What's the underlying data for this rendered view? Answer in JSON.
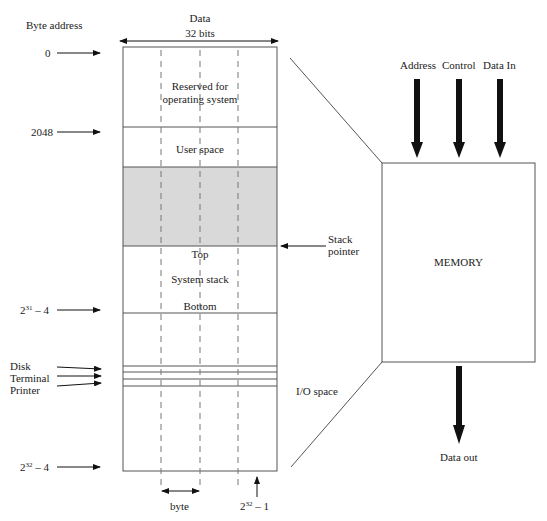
{
  "header": {
    "byte_address_label": "Byte address",
    "data_label": "Data",
    "width_label": "32 bits"
  },
  "addresses": {
    "a0": "0",
    "a2048": "2048",
    "a31_base": "2",
    "a31_exp": "31",
    "a31_suffix": " – 4",
    "a32_base": "2",
    "a32_exp": "32",
    "a32_suffix": " – 4"
  },
  "regions": {
    "reserved_line1": "Reserved for",
    "reserved_line2": "operating system",
    "user_space": "User space",
    "stack_top": "Top",
    "system_stack": "System stack",
    "stack_bottom": "Bottom",
    "io_space": "I/O space"
  },
  "devices": {
    "disk": "Disk",
    "terminal": "Terminal",
    "printer": "Printer"
  },
  "pointers": {
    "stack_pointer_line1": "Stack",
    "stack_pointer_line2": "pointer"
  },
  "footer": {
    "byte_label": "byte",
    "last_base": "2",
    "last_exp": "32",
    "last_suffix": " – 1"
  },
  "memory": {
    "label": "MEMORY",
    "inputs": [
      "Address",
      "Control",
      "Data In"
    ],
    "output": "Data out"
  },
  "colors": {
    "line": "#555555",
    "shaded": "#d9d9d9",
    "arrow": "#111111"
  }
}
